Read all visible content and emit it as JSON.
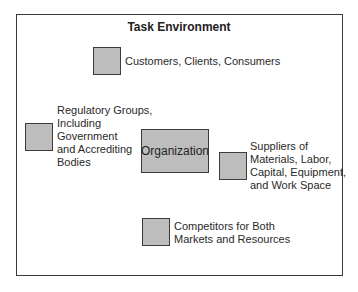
{
  "diagram": {
    "title": "Task Environment",
    "center": {
      "label": "Organization"
    },
    "elements": [
      {
        "id": "customers",
        "label": "Customers, Clients, Consumers"
      },
      {
        "id": "regulatory",
        "lines": [
          "Regulatory Groups,",
          "Including",
          "Government",
          "and Accrediting",
          "Bodies"
        ]
      },
      {
        "id": "suppliers",
        "lines": [
          "Suppliers of",
          "Materials, Labor,",
          "Capital, Equipment,",
          "and Work Space"
        ]
      },
      {
        "id": "competitors",
        "lines": [
          "Competitors for Both",
          "Markets and Resources"
        ]
      }
    ],
    "colors": {
      "box_fill": "#bdbdbd",
      "box_border": "#3c3c3c",
      "frame": "#3a3a3a"
    }
  }
}
